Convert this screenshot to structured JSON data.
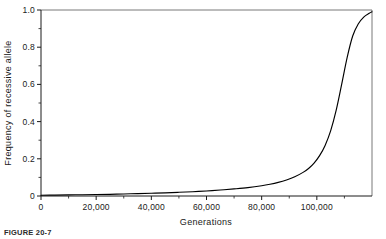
{
  "figure": {
    "caption": "FIGURE 20-7"
  },
  "chart_data": {
    "type": "line",
    "title": "",
    "xlabel": "Generations",
    "ylabel": "Frequency of recessive allele",
    "xlim": [
      0,
      120000
    ],
    "ylim": [
      0,
      1.0
    ],
    "grid": false,
    "legend": null,
    "x_ticks": [
      {
        "value": 0,
        "label": "0"
      },
      {
        "value": 20000,
        "label": "20,000"
      },
      {
        "value": 40000,
        "label": "40,000"
      },
      {
        "value": 60000,
        "label": "60,000"
      },
      {
        "value": 80000,
        "label": "80,000"
      },
      {
        "value": 100000,
        "label": "100,000"
      }
    ],
    "x_minor_ticks": [
      10000,
      30000,
      50000,
      70000,
      90000,
      110000
    ],
    "y_ticks": [
      {
        "value": 0,
        "label": "0"
      },
      {
        "value": 0.2,
        "label": "0.2"
      },
      {
        "value": 0.4,
        "label": "0.4"
      },
      {
        "value": 0.6,
        "label": "0.6"
      },
      {
        "value": 0.8,
        "label": "0.8"
      },
      {
        "value": 1.0,
        "label": "1.0"
      }
    ],
    "y_minor_ticks": [
      0.1,
      0.3,
      0.5,
      0.7,
      0.9
    ],
    "series": [
      {
        "name": "Frequency of recessive allele",
        "x": [
          0,
          5000,
          10000,
          15000,
          20000,
          25000,
          30000,
          35000,
          40000,
          45000,
          50000,
          55000,
          60000,
          65000,
          70000,
          75000,
          80000,
          83000,
          86000,
          89000,
          92000,
          95000,
          97000,
          99000,
          101000,
          103000,
          105000,
          107000,
          109000,
          111000,
          113000,
          115000,
          117000,
          119000,
          120000
        ],
        "y": [
          0.004,
          0.005,
          0.006,
          0.007,
          0.008,
          0.009,
          0.011,
          0.013,
          0.015,
          0.017,
          0.02,
          0.023,
          0.027,
          0.032,
          0.038,
          0.045,
          0.055,
          0.063,
          0.073,
          0.086,
          0.103,
          0.127,
          0.148,
          0.177,
          0.217,
          0.272,
          0.35,
          0.46,
          0.6,
          0.745,
          0.86,
          0.925,
          0.962,
          0.982,
          0.99
        ]
      }
    ]
  }
}
